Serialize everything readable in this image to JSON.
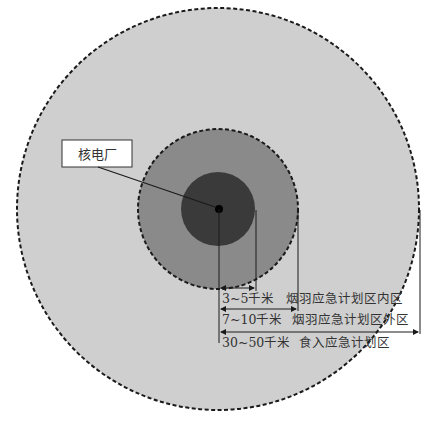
{
  "diagram": {
    "type": "concentric-zones",
    "center_label": "核电厂",
    "zones": [
      {
        "name": "inner",
        "distance": "3~5千米",
        "description": "烟羽应急计划区内区",
        "fill": "#3a3a3a",
        "radius_px": 37
      },
      {
        "name": "outer-plume",
        "distance": "7~10千米",
        "description": "烟羽应急计划区外区",
        "fill": "#8a8a8a",
        "radius_px": 80
      },
      {
        "name": "ingestion",
        "distance": "30~50千米",
        "description": "食入应急计划区",
        "fill": "#cfcfcf",
        "radius_px": 201
      }
    ],
    "colors": {
      "background": "#ffffff",
      "outline": "#1a1a1a",
      "text": "#333333",
      "center_dot": "#000000"
    }
  }
}
